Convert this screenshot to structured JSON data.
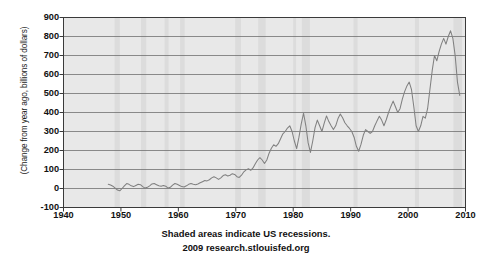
{
  "chart_data": {
    "type": "line",
    "title": "",
    "xlabel": "",
    "ylabel": "(Change from year ago, billions of dollars)",
    "xlim": [
      1940,
      2010
    ],
    "ylim": [
      -100,
      900
    ],
    "grid": true,
    "legend": null,
    "line_color": "#808080",
    "plot_background": "#e8e8e8",
    "recession_band_color": "#dcdcdc",
    "y_ticks": [
      900,
      800,
      700,
      600,
      500,
      400,
      300,
      200,
      100,
      0,
      -100
    ],
    "x_ticks": [
      1940,
      1950,
      1960,
      1970,
      1980,
      1990,
      2000,
      2010
    ],
    "recessions": [
      {
        "start": 1948.9,
        "end": 1949.8
      },
      {
        "start": 1953.5,
        "end": 1954.4
      },
      {
        "start": 1957.6,
        "end": 1958.3
      },
      {
        "start": 1960.3,
        "end": 1961.1
      },
      {
        "start": 1969.9,
        "end": 1970.9
      },
      {
        "start": 1973.9,
        "end": 1975.2
      },
      {
        "start": 1980.0,
        "end": 1980.5
      },
      {
        "start": 1981.5,
        "end": 1982.9
      },
      {
        "start": 1990.5,
        "end": 1991.2
      },
      {
        "start": 2001.2,
        "end": 2001.9
      },
      {
        "start": 2007.9,
        "end": 2009.4
      }
    ],
    "series": [
      {
        "name": "Change from year ago",
        "x": [
          1947.8,
          1948.2,
          1948.6,
          1949.0,
          1949.4,
          1949.8,
          1950.2,
          1950.6,
          1951.0,
          1951.4,
          1951.8,
          1952.2,
          1952.6,
          1953.0,
          1953.4,
          1953.8,
          1954.2,
          1954.6,
          1955.0,
          1955.4,
          1955.8,
          1956.2,
          1956.6,
          1957.0,
          1957.4,
          1957.8,
          1958.2,
          1958.6,
          1959.0,
          1959.4,
          1959.8,
          1960.2,
          1960.6,
          1961.0,
          1961.4,
          1961.8,
          1962.2,
          1962.6,
          1963.0,
          1963.4,
          1963.8,
          1964.2,
          1964.6,
          1965.0,
          1965.4,
          1965.8,
          1966.2,
          1966.6,
          1967.0,
          1967.4,
          1967.8,
          1968.2,
          1968.6,
          1969.0,
          1969.4,
          1969.8,
          1970.2,
          1970.6,
          1971.0,
          1971.4,
          1971.8,
          1972.2,
          1972.6,
          1973.0,
          1973.4,
          1973.8,
          1974.2,
          1974.6,
          1975.0,
          1975.4,
          1975.8,
          1976.2,
          1976.6,
          1977.0,
          1977.4,
          1977.8,
          1978.2,
          1978.6,
          1979.0,
          1979.4,
          1979.8,
          1980.2,
          1980.6,
          1981.0,
          1981.4,
          1981.8,
          1982.2,
          1982.6,
          1983.0,
          1983.4,
          1983.8,
          1984.2,
          1984.6,
          1985.0,
          1985.4,
          1985.8,
          1986.2,
          1986.6,
          1987.0,
          1987.4,
          1987.8,
          1988.2,
          1988.6,
          1989.0,
          1989.4,
          1989.8,
          1990.2,
          1990.6,
          1991.0,
          1991.4,
          1991.8,
          1992.2,
          1992.6,
          1993.0,
          1993.4,
          1993.8,
          1994.2,
          1994.6,
          1995.0,
          1995.4,
          1995.8,
          1996.2,
          1996.6,
          1997.0,
          1997.4,
          1997.8,
          1998.2,
          1998.6,
          1999.0,
          1999.4,
          1999.8,
          2000.2,
          2000.6,
          2001.0,
          2001.4,
          2001.8,
          2002.2,
          2002.6,
          2003.0,
          2003.4,
          2003.8,
          2004.2,
          2004.6,
          2005.0,
          2005.4,
          2005.8,
          2006.2,
          2006.6,
          2007.0,
          2007.4,
          2007.8,
          2008.2,
          2008.6,
          2009.0
        ],
        "y": [
          22,
          18,
          12,
          2,
          -8,
          -12,
          0,
          14,
          26,
          22,
          14,
          10,
          16,
          22,
          20,
          10,
          2,
          6,
          14,
          24,
          26,
          20,
          14,
          12,
          16,
          12,
          2,
          6,
          18,
          26,
          22,
          16,
          10,
          8,
          14,
          22,
          26,
          22,
          20,
          24,
          30,
          36,
          42,
          40,
          46,
          56,
          62,
          56,
          48,
          56,
          68,
          72,
          66,
          70,
          78,
          74,
          62,
          58,
          70,
          88,
          98,
          104,
          96,
          108,
          130,
          150,
          162,
          150,
          132,
          150,
          186,
          212,
          230,
          222,
          236,
          262,
          288,
          300,
          318,
          330,
          300,
          250,
          210,
          270,
          340,
          396,
          330,
          240,
          190,
          250,
          320,
          360,
          330,
          300,
          344,
          382,
          352,
          330,
          310,
          330,
          368,
          392,
          372,
          346,
          330,
          316,
          300,
          270,
          222,
          196,
          232,
          280,
          310,
          300,
          290,
          300,
          330,
          356,
          380,
          360,
          330,
          362,
          400,
          432,
          460,
          430,
          400,
          420,
          470,
          510,
          540,
          560,
          520,
          430,
          330,
          300,
          330,
          380,
          370,
          420,
          520,
          620,
          700,
          672,
          720,
          760,
          790,
          760,
          800,
          830,
          790,
          700,
          560,
          490
        ]
      }
    ],
    "caption": {
      "line1": "Shaded areas indicate US recessions.",
      "line2": "2009 research.stlouisfed.org"
    }
  }
}
